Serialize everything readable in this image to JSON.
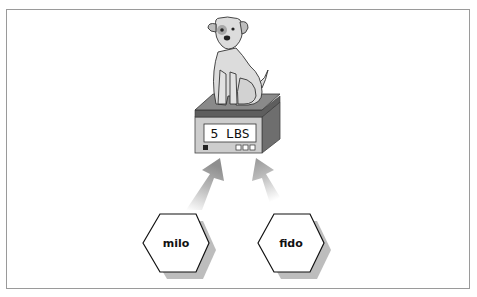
{
  "diagram": {
    "scale": {
      "display": "5 LBS"
    },
    "nodes": [
      {
        "id": "milo",
        "label": "milo"
      },
      {
        "id": "fido",
        "label": "fido"
      }
    ],
    "colors": {
      "border": "#9a9a9a",
      "dog_fill": "#d9d9d9",
      "scale_top": "#7a7a7a",
      "scale_front": "#c8c8c8",
      "scale_side": "#6e6e6e",
      "arrow": "#9c9c9c",
      "hex_shadow": "#bdbdbd"
    }
  }
}
